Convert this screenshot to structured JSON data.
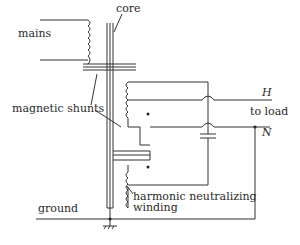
{
  "diagram": {
    "type": "transformer-schematic",
    "labels": {
      "mains": "mains",
      "core": "core",
      "magnetic_shunts": "magnetic shunts",
      "H": "H",
      "to_load": "to load",
      "N": "N",
      "harmonic_line1": "harmonic neutralizing",
      "harmonic_line2": "winding",
      "ground": "ground"
    },
    "components": [
      {
        "name": "primary-winding",
        "connected_to": "mains"
      },
      {
        "name": "core",
        "orientation": "vertical"
      },
      {
        "name": "magnetic-shunt-upper"
      },
      {
        "name": "magnetic-shunt-lower"
      },
      {
        "name": "secondary-winding",
        "output": "H"
      },
      {
        "name": "harmonic-neutralizing-winding"
      },
      {
        "name": "capacitor"
      },
      {
        "name": "ground-symbol"
      }
    ],
    "stroke_color": "#333333"
  }
}
